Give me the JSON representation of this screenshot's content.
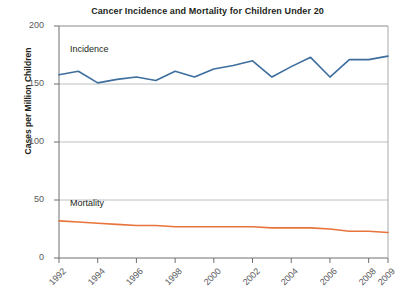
{
  "chart_data": {
    "type": "line",
    "title": "Cancer Incidence and Mortality for Children Under 20",
    "xlabel": "",
    "ylabel": "Cases per Million Children",
    "x": [
      1992,
      1993,
      1994,
      1995,
      1996,
      1997,
      1998,
      1999,
      2000,
      2001,
      2002,
      2003,
      2004,
      2005,
      2006,
      2007,
      2008,
      2009
    ],
    "xlim": [
      1992,
      2009
    ],
    "ylim": [
      0,
      200
    ],
    "yticks": [
      0,
      50,
      100,
      150,
      200
    ],
    "xticks": [
      1992,
      1994,
      1996,
      1998,
      2000,
      2002,
      2004,
      2006,
      2008,
      2009
    ],
    "xtick_labels": [
      "1992",
      "1994",
      "1996",
      "1998",
      "2000",
      "2002",
      "2004",
      "2006",
      "2008",
      "2009"
    ],
    "ytick_labels": [
      "0",
      "50",
      "100",
      "150",
      "200"
    ],
    "grid": "horizontal",
    "legend_position": "inline-labels",
    "series": [
      {
        "name": "Incidence",
        "color": "#3d6e9e",
        "values": [
          158,
          161,
          151,
          154,
          156,
          153,
          161,
          156,
          163,
          166,
          170,
          156,
          165,
          173,
          156,
          171,
          171,
          174
        ]
      },
      {
        "name": "Mortality",
        "color": "#e8743b",
        "values": [
          32,
          31,
          30,
          29,
          28,
          28,
          27,
          27,
          27,
          27,
          27,
          26,
          26,
          26,
          25,
          23,
          23,
          22
        ]
      }
    ]
  },
  "labels": {
    "incidence": "Incidence",
    "mortality": "Mortality"
  }
}
